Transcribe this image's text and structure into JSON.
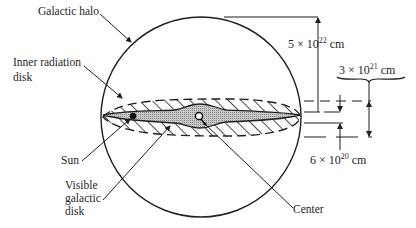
{
  "diagram": {
    "labels": {
      "galactic_halo": "Galactic halo",
      "inner_radiation_disk_line1": "Inner radiation",
      "inner_radiation_disk_line2": "disk",
      "sun": "Sun",
      "visible_disk_line1": "Visible",
      "visible_disk_line2": "galactic",
      "visible_disk_line3": "disk",
      "center": "Center"
    },
    "dimensions": {
      "halo_radius": {
        "mantissa": "5 × 10",
        "exponent": "22",
        "unit": " cm"
      },
      "radiation_disk_thickness": {
        "mantissa": "3 × 10",
        "exponent": "21",
        "unit": " cm"
      },
      "visible_disk_thickness": {
        "mantissa": "6 × 10",
        "exponent": "20",
        "unit": " cm"
      }
    },
    "colors": {
      "ink": "#1f1f1f",
      "visible_disk_fill": "#bdbdbd",
      "background": "#ffffff"
    }
  }
}
